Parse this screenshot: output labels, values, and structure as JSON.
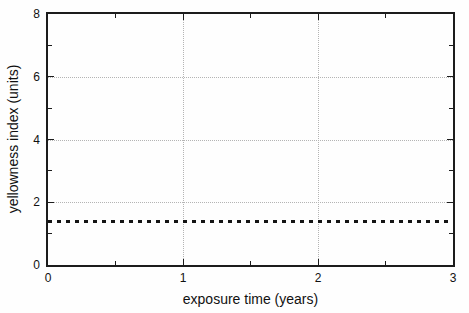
{
  "figure": {
    "colors": {
      "background": "#fefefe",
      "frame": "#1c1c1c",
      "grid": "#b4b4b4",
      "line": "#141414",
      "text": "#111111"
    }
  },
  "chart_data": {
    "type": "line",
    "title": "",
    "xlabel": "exposure time (years)",
    "ylabel": "yellowness index (units)",
    "xlim": [
      0,
      3
    ],
    "ylim": [
      0,
      8
    ],
    "x_major_ticks": [
      0,
      1,
      2,
      3
    ],
    "x_minor_ticks": [
      0.5,
      1.5,
      2.5
    ],
    "y_major_ticks": [
      0,
      2,
      4,
      6,
      8
    ],
    "y_minor_ticks": [
      1,
      3,
      5,
      7
    ],
    "grid": true,
    "x_gridlines": [
      1,
      2
    ],
    "y_gridlines": [
      2,
      4,
      6
    ],
    "legend": "none",
    "series": [
      {
        "name": "yellowness index",
        "line_style": "dashed",
        "color": "#141414",
        "x": [
          0,
          3
        ],
        "values": [
          1.4,
          1.4
        ]
      }
    ]
  }
}
